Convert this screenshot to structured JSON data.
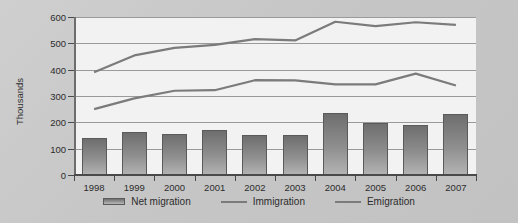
{
  "chart_data": {
    "type": "bar",
    "title": "",
    "subtitle": "",
    "xlabel": "",
    "ylabel": "Thousands",
    "ylim": [
      0,
      600
    ],
    "yticks": [
      0,
      100,
      200,
      300,
      400,
      500,
      600
    ],
    "ytick_labels": [
      "0",
      "100",
      "200",
      "300",
      "400",
      "500",
      "600"
    ],
    "grid": true,
    "legend_position": "bottom",
    "categories": [
      "1998",
      "1999",
      "2000",
      "2001",
      "2002",
      "2003",
      "2004",
      "2005",
      "2006",
      "2007"
    ],
    "series": [
      {
        "name": "Net migration",
        "type": "bar",
        "color": "#8f8f8f",
        "values": [
          140,
          163,
          157,
          172,
          153,
          152,
          235,
          198,
          190,
          233
        ]
      },
      {
        "name": "Immigration",
        "type": "line",
        "color": "#7b7b7b",
        "values": [
          390,
          454,
          483,
          494,
          516,
          511,
          582,
          565,
          580,
          570
        ]
      },
      {
        "name": "Emigration",
        "type": "line",
        "color": "#7b7b7b",
        "values": [
          250,
          291,
          320,
          322,
          360,
          359,
          344,
          344,
          385,
          340
        ]
      }
    ]
  },
  "legend": {
    "items": [
      {
        "label": "Net migration",
        "marker": "bar-swatch"
      },
      {
        "label": "Immigration",
        "marker": "line-swatch"
      },
      {
        "label": "Emigration",
        "marker": "line-swatch"
      }
    ]
  }
}
